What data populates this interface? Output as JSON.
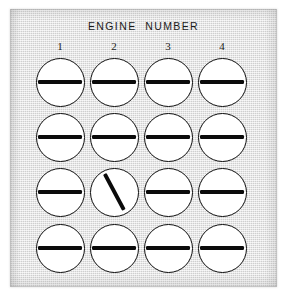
{
  "panel": {
    "title": "ENGINE  NUMBER",
    "background_color": "#e4e4e4",
    "border_color": "#9a9a9a",
    "dial_face_color": "#ffffff",
    "dial_outline_color": "#0d0d0d",
    "needle_color": "#0b0b0b"
  },
  "columns": [
    {
      "label": "1"
    },
    {
      "label": "2"
    },
    {
      "label": "3"
    },
    {
      "label": "4"
    }
  ],
  "rows": [
    {
      "index": 1
    },
    {
      "index": 2
    },
    {
      "index": 3
    },
    {
      "index": 4
    }
  ],
  "dials": [
    {
      "row": 1,
      "column": 1,
      "engine": "1",
      "needle_angle_deg": 0,
      "state": "horizontal"
    },
    {
      "row": 1,
      "column": 2,
      "engine": "2",
      "needle_angle_deg": 0,
      "state": "horizontal"
    },
    {
      "row": 1,
      "column": 3,
      "engine": "3",
      "needle_angle_deg": 0,
      "state": "horizontal"
    },
    {
      "row": 1,
      "column": 4,
      "engine": "4",
      "needle_angle_deg": 0,
      "state": "horizontal"
    },
    {
      "row": 2,
      "column": 1,
      "engine": "1",
      "needle_angle_deg": 0,
      "state": "horizontal"
    },
    {
      "row": 2,
      "column": 2,
      "engine": "2",
      "needle_angle_deg": 0,
      "state": "horizontal"
    },
    {
      "row": 2,
      "column": 3,
      "engine": "3",
      "needle_angle_deg": 0,
      "state": "horizontal"
    },
    {
      "row": 2,
      "column": 4,
      "engine": "4",
      "needle_angle_deg": 0,
      "state": "horizontal"
    },
    {
      "row": 3,
      "column": 1,
      "engine": "1",
      "needle_angle_deg": 0,
      "state": "horizontal"
    },
    {
      "row": 3,
      "column": 2,
      "engine": "2",
      "needle_angle_deg": 62,
      "state": "deflected"
    },
    {
      "row": 3,
      "column": 3,
      "engine": "3",
      "needle_angle_deg": 0,
      "state": "horizontal"
    },
    {
      "row": 3,
      "column": 4,
      "engine": "4",
      "needle_angle_deg": 0,
      "state": "horizontal"
    },
    {
      "row": 4,
      "column": 1,
      "engine": "1",
      "needle_angle_deg": 0,
      "state": "horizontal"
    },
    {
      "row": 4,
      "column": 2,
      "engine": "2",
      "needle_angle_deg": 0,
      "state": "horizontal"
    },
    {
      "row": 4,
      "column": 3,
      "engine": "3",
      "needle_angle_deg": 0,
      "state": "horizontal"
    },
    {
      "row": 4,
      "column": 4,
      "engine": "4",
      "needle_angle_deg": 0,
      "state": "horizontal"
    }
  ],
  "layout": {
    "column_x": [
      50,
      104,
      158,
      212
    ],
    "row_y": [
      73,
      128,
      183,
      239
    ],
    "dial_diameter": 49
  }
}
